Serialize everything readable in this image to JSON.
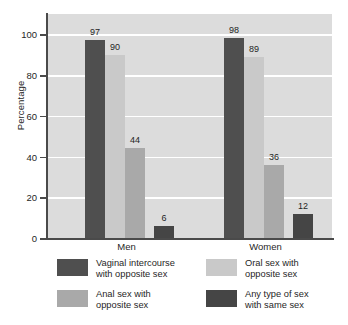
{
  "chart_data": {
    "type": "bar",
    "title": "",
    "xlabel": "",
    "ylabel": "Percentage",
    "ylim": [
      0,
      110
    ],
    "yticks": [
      0,
      20,
      40,
      60,
      80,
      100
    ],
    "grid": true,
    "grid_color": "#ffffff",
    "plot_background": "#dcdcdc",
    "legend_position": "below",
    "categories": [
      "Men",
      "Women"
    ],
    "series": [
      {
        "name": "Vaginal intercourse with opposite sex",
        "name_line1": "Vaginal intercourse",
        "name_line2": "with opposite sex",
        "color": "#4f4f4f",
        "values": [
          97,
          98
        ]
      },
      {
        "name": "Oral sex with opposite sex",
        "name_line1": "Oral sex with",
        "name_line2": "opposite sex",
        "color": "#c9c9c9",
        "values": [
          90,
          89
        ]
      },
      {
        "name": "Anal sex with opposite sex",
        "name_line1": "Anal sex with",
        "name_line2": "opposite sex",
        "color": "#a9a9a9",
        "values": [
          44,
          36
        ]
      },
      {
        "name": "Any type of sex with same sex",
        "name_line1": "Any type of sex",
        "name_line2": "with same sex",
        "color": "#454545",
        "values": [
          6,
          12
        ]
      }
    ],
    "bar_labels": {
      "men": [
        "97",
        "90",
        "44",
        "6"
      ],
      "women": [
        "98",
        "89",
        "36",
        "12"
      ]
    }
  },
  "axis": {
    "y_title": "Percentage",
    "y_tick_labels": [
      "100",
      "80",
      "60",
      "40",
      "20",
      "0"
    ],
    "x_tick_labels": [
      "Men",
      "Women"
    ]
  }
}
